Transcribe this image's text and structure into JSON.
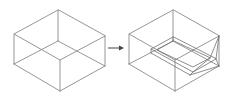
{
  "diagram": {
    "type": "transformation",
    "description_items": [
      {
        "id": "box-wireframe",
        "label": ""
      },
      {
        "id": "arrow",
        "label": ""
      },
      {
        "id": "box-with-tray",
        "label": ""
      }
    ],
    "colors": {
      "background": "#ffffff",
      "edge": "#8a8a8a",
      "inner_edge": "#707070",
      "arrow": "#444444"
    },
    "left_box": {
      "vertices": {
        "top_back": [
          58,
          10
        ],
        "left_top": [
          14,
          34
        ],
        "left_bottom": [
          14,
          64
        ],
        "front_top": [
          60,
          60
        ],
        "front_bottom": [
          60,
          91
        ],
        "right_top": [
          105,
          36
        ],
        "right_bottom": [
          105,
          66
        ],
        "hidden_back": [
          58,
          41
        ]
      }
    },
    "arrow": {
      "from": [
        108,
        48
      ],
      "to": [
        124,
        48
      ]
    },
    "right_box": {
      "vertices": {
        "top_back": [
          173,
          10
        ],
        "left_top": [
          129,
          34
        ],
        "left_bottom": [
          129,
          64
        ],
        "front_top": [
          175,
          60
        ],
        "front_bottom": [
          175,
          91
        ],
        "right_top": [
          219,
          36
        ],
        "right_bottom": [
          219,
          66
        ],
        "hidden_back": [
          173,
          41
        ]
      }
    }
  }
}
